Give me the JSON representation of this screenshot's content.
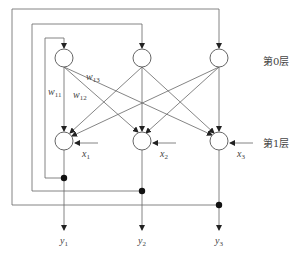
{
  "diagram": {
    "layers": [
      {
        "label": "第0层",
        "neurons": 3
      },
      {
        "label": "第1层",
        "neurons": 3
      }
    ],
    "weights": [
      "w11",
      "w12",
      "w13"
    ],
    "weight_labels": {
      "w11": "w",
      "w11_sub": "11",
      "w12": "w",
      "w12_sub": "12",
      "w13": "w",
      "w13_sub": "13"
    },
    "inputs": [
      {
        "name": "x",
        "sub": "1"
      },
      {
        "name": "x",
        "sub": "2"
      },
      {
        "name": "x",
        "sub": "3"
      }
    ],
    "outputs": [
      {
        "name": "y",
        "sub": "1"
      },
      {
        "name": "y",
        "sub": "2"
      },
      {
        "name": "y",
        "sub": "3"
      }
    ],
    "colors": {
      "line": "#555555",
      "dot": "#111111",
      "text": "#444444"
    }
  }
}
